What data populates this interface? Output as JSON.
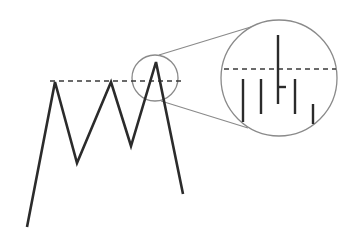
{
  "diagram": {
    "colors": {
      "line": "#2b2b2b",
      "dashed": "#3a3a3a",
      "circle": "#8a8a8a",
      "background": "#ffffff"
    },
    "price_path": [
      [
        27,
        227
      ],
      [
        55,
        82
      ],
      [
        77,
        163
      ],
      [
        111,
        82
      ],
      [
        131,
        146
      ],
      [
        156,
        62
      ],
      [
        183,
        194
      ]
    ],
    "resistance_line": {
      "x1": 50,
      "x2": 182,
      "y": 81
    },
    "zoom_source_circle": {
      "cx": 155,
      "cy": 78,
      "r": 23
    },
    "zoom_target_circle": {
      "cx": 279,
      "cy": 78,
      "r": 58
    },
    "connector_lines": [
      {
        "x1": 159,
        "y1": 55,
        "x2": 254,
        "y2": 26
      },
      {
        "x1": 161,
        "y1": 101,
        "x2": 248,
        "y2": 128
      }
    ],
    "magnified_resistance_line": {
      "x1": 224,
      "x2": 336,
      "y": 69
    },
    "magnified_bars": [
      {
        "x": 243,
        "top": 79,
        "bottom": 122
      },
      {
        "x": 261,
        "top": 79,
        "bottom": 114
      },
      {
        "x": 278,
        "top": 35,
        "bottom": 104,
        "tick_y": 87,
        "tick_len": 8
      },
      {
        "x": 295,
        "top": 79,
        "bottom": 114
      },
      {
        "x": 313,
        "top": 104,
        "bottom": 124
      }
    ]
  }
}
